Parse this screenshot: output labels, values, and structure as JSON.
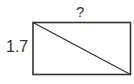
{
  "diagram": {
    "type": "rectangle-with-diagonal",
    "labels": {
      "top_side": "?",
      "left_side": "1.7"
    },
    "colors": {
      "stroke": "#333333",
      "background": "#ffffff",
      "text": "#333333"
    }
  }
}
